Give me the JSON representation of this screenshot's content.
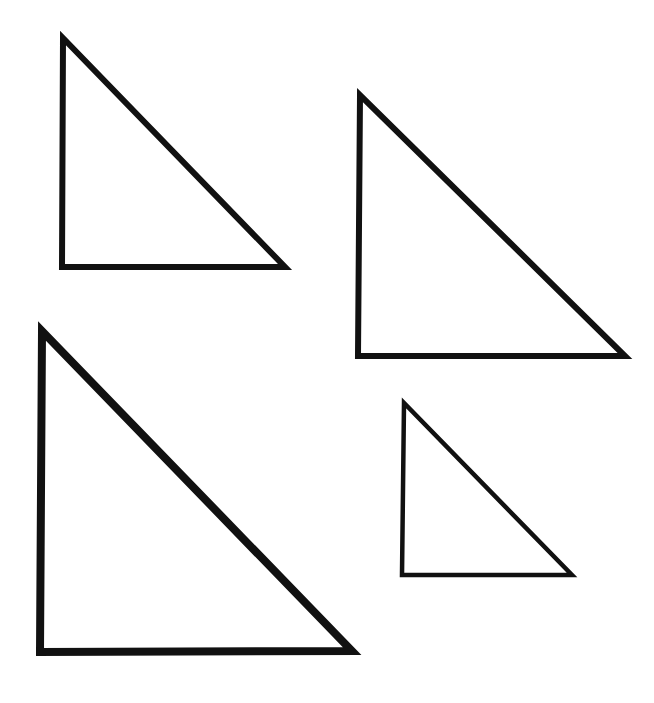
{
  "figure": {
    "canvas": {
      "width": 654,
      "height": 703,
      "background_color": "#ffffff"
    },
    "stroke_color": "#111111",
    "fill_color": "none",
    "shape_count": 4,
    "shape_kind": "right-triangle"
  },
  "shapes": [
    {
      "id": "triangle-large-upper-left",
      "label": "Upper-left triangle",
      "size_rank": "medium-large",
      "stroke_width": 6,
      "stroke_color": "#111111",
      "fill": "none",
      "points": "63,38 62,267 285,267",
      "vertices": {
        "apex": [
          63,
          38
        ],
        "right_angle": [
          62,
          267
        ],
        "lower_right": [
          285,
          267
        ]
      },
      "width_px": 223,
      "height_px": 229
    },
    {
      "id": "triangle-upper-right",
      "label": "Upper-right triangle",
      "size_rank": "large",
      "stroke_width": 6,
      "stroke_color": "#111111",
      "fill": "none",
      "points": "360,95 358,356 625,356",
      "vertices": {
        "apex": [
          360,
          95
        ],
        "right_angle": [
          358,
          356
        ],
        "lower_right": [
          625,
          356
        ]
      },
      "width_px": 267,
      "height_px": 261
    },
    {
      "id": "triangle-lower-left",
      "label": "Lower-left triangle",
      "size_rank": "largest",
      "stroke_width": 8,
      "stroke_color": "#111111",
      "fill": "none",
      "points": "42,331 40,652 352,651",
      "vertices": {
        "apex": [
          42,
          331
        ],
        "right_angle": [
          40,
          652
        ],
        "lower_right": [
          352,
          651
        ]
      },
      "width_px": 312,
      "height_px": 321
    },
    {
      "id": "triangle-small-lower-right",
      "label": "Lower-right small triangle",
      "size_rank": "smallest",
      "stroke_width": 4.5,
      "stroke_color": "#111111",
      "fill": "none",
      "points": "404,403 402,575 572,575",
      "vertices": {
        "apex": [
          404,
          403
        ],
        "right_angle": [
          402,
          575
        ],
        "lower_right": [
          572,
          575
        ]
      },
      "width_px": 170,
      "height_px": 172
    }
  ]
}
